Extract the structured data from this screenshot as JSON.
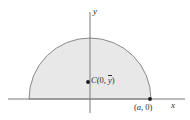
{
  "figure": {
    "background_color": "#ffffff",
    "region": {
      "shape": "semicircle",
      "fill_color": "#e8e8e8",
      "stroke_color": "#8a8a8a",
      "center": {
        "x": 0,
        "y": 0
      },
      "radius_label": "a",
      "half": "upper"
    },
    "axes": {
      "x_label": "x",
      "y_label": "y",
      "axis_color": "#7a7a7a",
      "origin_px": {
        "x": 90,
        "y": 99
      },
      "x_axis_span_px": {
        "start": 8,
        "end": 185
      },
      "y_axis_span_px": {
        "start": 12,
        "end": 113
      }
    },
    "points": [
      {
        "name": "centroid",
        "marker_label": "C",
        "coordinate_text": "(0, ȳ)",
        "coord_x_text": "0",
        "coord_y_text": "y",
        "pixel": {
          "x": 88,
          "y": 82
        },
        "dot_color": "#1a1a1a"
      },
      {
        "name": "radius-endpoint",
        "marker_label": "",
        "coordinate_text": "(a, 0)",
        "coord_x_text": "a",
        "coord_y_text": "0",
        "pixel": {
          "x": 150,
          "y": 99
        },
        "dot_color": "#1a1a1a"
      }
    ],
    "punctuation": {
      "open_paren": "(",
      "close_paren": ")",
      "comma": ","
    }
  }
}
